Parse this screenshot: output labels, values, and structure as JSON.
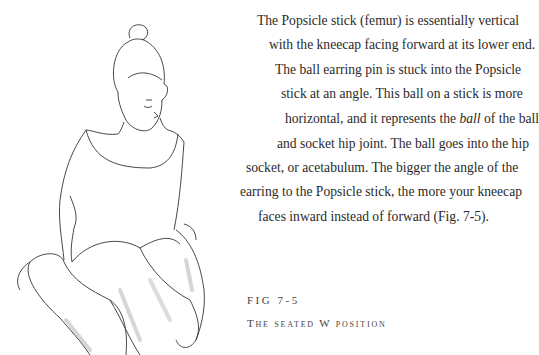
{
  "body_text": {
    "lines": [
      "The Popsicle stick (femur) is essentially vertical",
      "with the kneecap facing forward at its lower end.",
      "The ball earring pin is stuck into the Popsicle",
      "stick at an angle. This ball on a stick is more",
      "horizontal, and it represents the ",
      "and socket hip joint. The ball goes into the hip",
      "socket, or acetabulum. The bigger the angle of the",
      "earring to the Popsicle stick, the more your kneecap",
      "faces inward instead of forward (Fig. 7-5)."
    ],
    "italic_word": "ball",
    "line5_tail": " of the ball"
  },
  "figure": {
    "label": "FIG 7-5",
    "caption": "The seated W position",
    "illustration": "girl-seated-w-position-line-drawing"
  }
}
